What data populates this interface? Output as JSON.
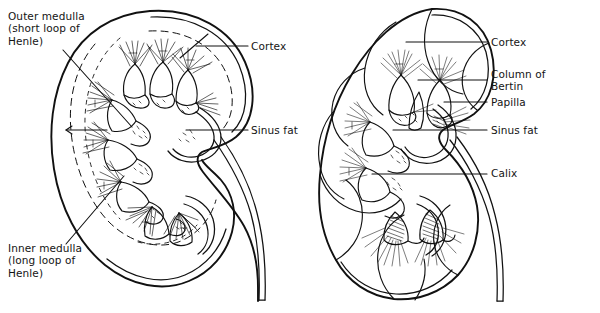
{
  "figure": {
    "background_color": "#ffffff",
    "ink_color": "#111111",
    "text_color": "#141414",
    "width": 600,
    "height": 313
  },
  "labels": {
    "outer_medulla": "Outer medulla\n(short loop of\nHenle)",
    "inner_medulla": "Inner medulla\n(long loop of\nHenle)",
    "cortex_left": "Cortex",
    "sinus_fat_left": "Sinus fat",
    "cortex_right": "Cortex",
    "column_of_bertin": "Column of\nBertin",
    "papilla": "Papilla",
    "sinus_fat_right": "Sinus fat",
    "calix": "Calix"
  },
  "diagrams": [
    {
      "name": "adult-kidney-cross-section",
      "side": "left",
      "callouts": [
        "Outer medulla (short loop of Henle)",
        "Inner medulla (long loop of Henle)",
        "Cortex",
        "Sinus fat"
      ]
    },
    {
      "name": "fetal-lobulated-kidney-cross-section",
      "side": "right",
      "callouts": [
        "Cortex",
        "Column of Bertin",
        "Papilla",
        "Sinus fat",
        "Calix"
      ]
    }
  ]
}
